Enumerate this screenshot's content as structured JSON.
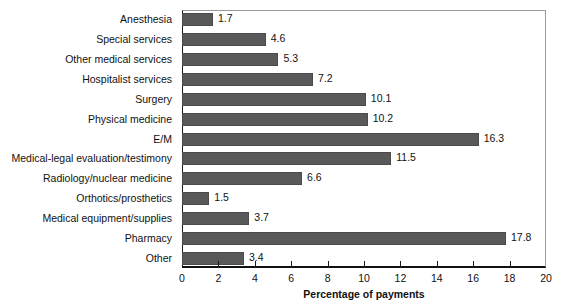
{
  "chart_data": {
    "type": "bar",
    "orientation": "horizontal",
    "title": "",
    "xlabel": "Percentage of payments",
    "ylabel": "",
    "xlim": [
      0,
      20
    ],
    "xticks": [
      0,
      2,
      4,
      6,
      8,
      10,
      12,
      14,
      16,
      18,
      20
    ],
    "grid": false,
    "legend": null,
    "bar_color": "#595959",
    "categories": [
      "Anesthesia",
      "Special services",
      "Other medical services",
      "Hospitalist services",
      "Surgery",
      "Physical medicine",
      "E/M",
      "Medical-legal evaluation/testimony",
      "Radiology/nuclear medicine",
      "Orthotics/prosthetics",
      "Medical equipment/supplies",
      "Pharmacy",
      "Other"
    ],
    "values": [
      1.7,
      4.6,
      5.3,
      7.2,
      10.1,
      10.2,
      16.3,
      11.5,
      6.6,
      1.5,
      3.7,
      17.8,
      3.4
    ],
    "value_labels": [
      "1.7",
      "4.6",
      "5.3",
      "7.2",
      "10.1",
      "10.2",
      "16.3",
      "11.5",
      "6.6",
      "1.5",
      "3.7",
      "17.8",
      "3.4"
    ],
    "tick_labels": [
      "0",
      "2",
      "4",
      "6",
      "8",
      "10",
      "12",
      "14",
      "16",
      "18",
      "20"
    ]
  }
}
